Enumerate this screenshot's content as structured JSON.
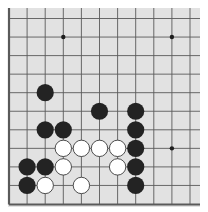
{
  "game": "go",
  "view": "bottom-left corner fragment",
  "colors": {
    "board": "#e2e2e2",
    "grid": "#5a5a5a",
    "black_stone": "#232323",
    "white_stone": "#ffffff",
    "white_outline": "#3a3a3a",
    "star_point": "#1e1e1e"
  },
  "grid": {
    "columns": 11,
    "rows": 11,
    "note": "column 0 is the left board edge, row 10 is the bottom board edge; top and right extend beyond view"
  },
  "star_points": [
    {
      "col": 3,
      "row": 1
    },
    {
      "col": 9,
      "row": 1
    },
    {
      "col": 9,
      "row": 7
    }
  ],
  "stones": [
    {
      "color": "black",
      "col": 2,
      "row": 4
    },
    {
      "color": "black",
      "col": 5,
      "row": 5
    },
    {
      "color": "black",
      "col": 7,
      "row": 5
    },
    {
      "color": "black",
      "col": 2,
      "row": 6
    },
    {
      "color": "black",
      "col": 3,
      "row": 6
    },
    {
      "color": "black",
      "col": 7,
      "row": 6
    },
    {
      "color": "white",
      "col": 3,
      "row": 7
    },
    {
      "color": "white",
      "col": 4,
      "row": 7
    },
    {
      "color": "white",
      "col": 5,
      "row": 7
    },
    {
      "color": "white",
      "col": 6,
      "row": 7
    },
    {
      "color": "black",
      "col": 7,
      "row": 7
    },
    {
      "color": "black",
      "col": 1,
      "row": 8
    },
    {
      "color": "black",
      "col": 2,
      "row": 8
    },
    {
      "color": "white",
      "col": 3,
      "row": 8
    },
    {
      "color": "white",
      "col": 6,
      "row": 8
    },
    {
      "color": "black",
      "col": 7,
      "row": 8
    },
    {
      "color": "black",
      "col": 1,
      "row": 9
    },
    {
      "color": "white",
      "col": 2,
      "row": 9
    },
    {
      "color": "white",
      "col": 4,
      "row": 9
    },
    {
      "color": "black",
      "col": 7,
      "row": 9
    }
  ]
}
